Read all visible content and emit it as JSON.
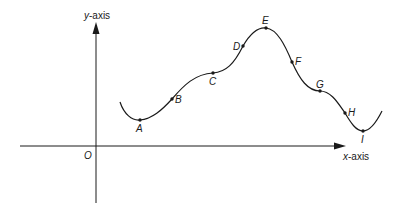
{
  "diagram": {
    "y_axis_label_var": "y",
    "y_axis_label_suffix": "-axis",
    "x_axis_label_var": "x",
    "x_axis_label_suffix": "-axis",
    "origin_label": "O",
    "points": [
      {
        "label": "A",
        "x": 140,
        "y": 120
      },
      {
        "label": "B",
        "x": 172,
        "y": 99
      },
      {
        "label": "C",
        "x": 213,
        "y": 73
      },
      {
        "label": "D",
        "x": 243,
        "y": 46
      },
      {
        "label": "E",
        "x": 266,
        "y": 28
      },
      {
        "label": "F",
        "x": 292,
        "y": 62
      },
      {
        "label": "G",
        "x": 320,
        "y": 91
      },
      {
        "label": "H",
        "x": 345,
        "y": 113
      },
      {
        "label": "I",
        "x": 363,
        "y": 131
      }
    ],
    "colors": {
      "stroke": "#1a1a1a",
      "background": "#ffffff"
    }
  }
}
